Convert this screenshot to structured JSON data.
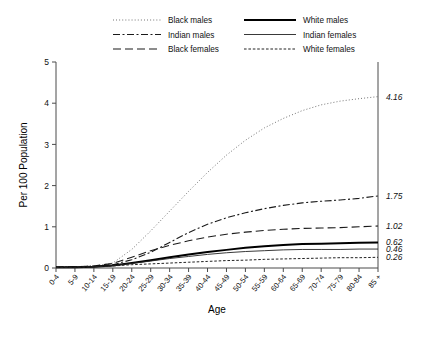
{
  "chart_data": {
    "type": "line",
    "title": "",
    "xlabel": "Age",
    "ylabel": "Per 100 Population",
    "ylim": [
      0,
      5
    ],
    "yticks": [
      "0",
      "1",
      "2",
      "3",
      "4",
      "5"
    ],
    "grid": false,
    "legend_position": "top",
    "categories": [
      "0-4",
      "5-9",
      "10-14",
      "15-19",
      "20-24",
      "25-29",
      "30-34",
      "35-39",
      "40-44",
      "45-49",
      "50-54",
      "55-59",
      "60-64",
      "65-69",
      "70-74",
      "75-79",
      "80-84",
      "85 +"
    ],
    "series": [
      {
        "name": "Black males",
        "style": "dotted",
        "end_label": "4.16",
        "values": [
          0.02,
          0.03,
          0.05,
          0.12,
          0.45,
          0.9,
          1.38,
          1.86,
          2.32,
          2.74,
          3.1,
          3.4,
          3.63,
          3.82,
          3.96,
          4.05,
          4.11,
          4.16
        ]
      },
      {
        "name": "Indian males",
        "style": "dash-dot",
        "end_label": "1.75",
        "values": [
          0.02,
          0.03,
          0.04,
          0.08,
          0.2,
          0.38,
          0.62,
          0.86,
          1.06,
          1.22,
          1.34,
          1.44,
          1.52,
          1.58,
          1.62,
          1.65,
          1.69,
          1.75
        ]
      },
      {
        "name": "Black females",
        "style": "long-dash",
        "end_label": "1.02",
        "values": [
          0.02,
          0.03,
          0.05,
          0.11,
          0.26,
          0.42,
          0.55,
          0.66,
          0.75,
          0.82,
          0.87,
          0.91,
          0.94,
          0.96,
          0.97,
          0.98,
          1.0,
          1.02
        ]
      },
      {
        "name": "White males",
        "style": "thick-solid",
        "end_label": "0.62",
        "values": [
          0.02,
          0.02,
          0.03,
          0.06,
          0.12,
          0.19,
          0.26,
          0.33,
          0.39,
          0.44,
          0.49,
          0.53,
          0.56,
          0.58,
          0.59,
          0.6,
          0.61,
          0.62
        ]
      },
      {
        "name": "Indian females",
        "style": "thin-solid",
        "end_label": "0.46",
        "values": [
          0.02,
          0.02,
          0.03,
          0.06,
          0.11,
          0.17,
          0.23,
          0.28,
          0.33,
          0.37,
          0.4,
          0.42,
          0.44,
          0.45,
          0.45,
          0.45,
          0.46,
          0.46
        ]
      },
      {
        "name": "White females",
        "style": "short-dash",
        "end_label": "0.26",
        "values": [
          0.01,
          0.02,
          0.03,
          0.05,
          0.08,
          0.1,
          0.12,
          0.14,
          0.16,
          0.18,
          0.19,
          0.21,
          0.22,
          0.23,
          0.24,
          0.25,
          0.25,
          0.26
        ]
      }
    ]
  },
  "legend": {
    "column_left": [
      {
        "label": "Black males",
        "style": "dotted"
      },
      {
        "label": "Indian males",
        "style": "dash-dot"
      },
      {
        "label": "Black females",
        "style": "long-dash"
      }
    ],
    "column_right": [
      {
        "label": "White males",
        "style": "thick-solid"
      },
      {
        "label": "Indian females",
        "style": "thin-solid"
      },
      {
        "label": "White females",
        "style": "short-dash"
      }
    ]
  }
}
